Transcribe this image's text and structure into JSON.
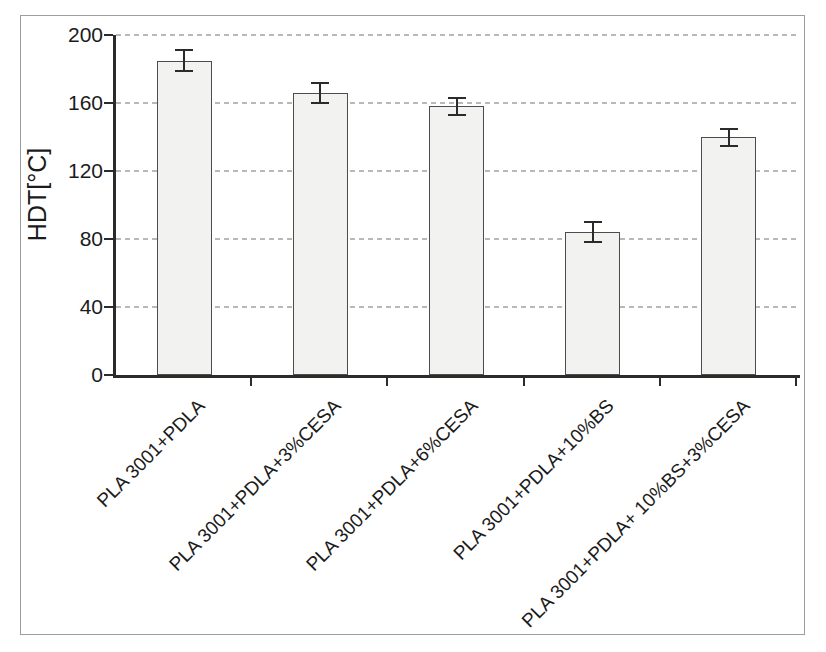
{
  "figure": {
    "background": "#ffffff",
    "border_color": "#9e9e9e"
  },
  "chart_data": {
    "type": "bar",
    "ylabel": "HDT[°C]",
    "ylim": [
      0,
      200
    ],
    "yticks": [
      0,
      40,
      80,
      120,
      160,
      200
    ],
    "grid": "horizontal-dashed",
    "legend": "none",
    "categories": [
      "PLA 3001+PDLA",
      "PLA 3001+PDLA+3%CESA",
      "PLA 3001+PDLA+6%CESA",
      "PLA 3001+PDLA+10%BS",
      "PLA 3001+PDLA+ 10%BS+3%CESA"
    ],
    "values": [
      185,
      166,
      158,
      84,
      140
    ],
    "errors": [
      6,
      6,
      5,
      6,
      5
    ],
    "colors": {
      "bar_fill": "#f2f2f0",
      "bar_border": "#4c4c4c",
      "axis": "#2b2b2b",
      "grid": "#b8b8b8",
      "text": "#1b1b1b"
    }
  }
}
